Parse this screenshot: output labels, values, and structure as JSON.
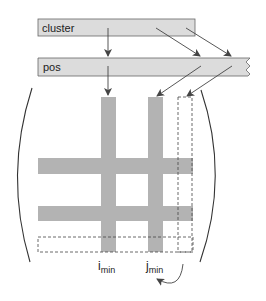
{
  "diagram": {
    "arrays": [
      {
        "id": "cluster",
        "label": "cluster"
      },
      {
        "id": "pos",
        "label": "pos"
      }
    ],
    "matrix": {
      "row_labels": [],
      "column_labels": [
        {
          "id": "i_min",
          "base": "i",
          "sub": "min"
        },
        {
          "id": "j_min",
          "base": "j",
          "sub": "min"
        }
      ]
    },
    "colors": {
      "array_fill": "#dcdcdc",
      "bar_fill": "#b3b3b3",
      "stroke": "#555555",
      "arrow": "#444444"
    }
  }
}
